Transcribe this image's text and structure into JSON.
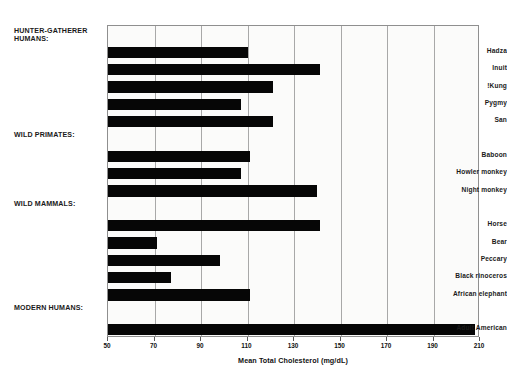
{
  "chart_data": {
    "type": "bar",
    "orientation": "horizontal",
    "title": "",
    "xlabel": "Mean Total Cholesterol (mg/dL)",
    "ylabel": "",
    "xlim": [
      50,
      210
    ],
    "xticks": [
      50,
      70,
      90,
      110,
      130,
      150,
      170,
      190,
      210
    ],
    "grid": true,
    "legend": null,
    "bar_color": "#060606",
    "plot_background": "#fbfbfa",
    "grid_color": "#a8a8a8",
    "groups": [
      {
        "header": "HUNTER-GATHERER\nHUMANS:",
        "categories": [
          "Hadza",
          "Inuit",
          "!Kung",
          "Pygmy",
          "San"
        ],
        "values": [
          110,
          141,
          121,
          107,
          121
        ]
      },
      {
        "header": "WILD PRIMATES:",
        "categories": [
          "Baboon",
          "Howler monkey",
          "Night monkey"
        ],
        "values": [
          111,
          107,
          140
        ]
      },
      {
        "header": "WILD MAMMALS:",
        "categories": [
          "Horse",
          "Bear",
          "Peccary",
          "Black rinoceros",
          "African elephant"
        ],
        "values": [
          141,
          71,
          98,
          77,
          111
        ]
      },
      {
        "header": "MODERN HUMANS:",
        "categories": [
          "Adult American"
        ],
        "values": [
          208
        ]
      }
    ]
  }
}
